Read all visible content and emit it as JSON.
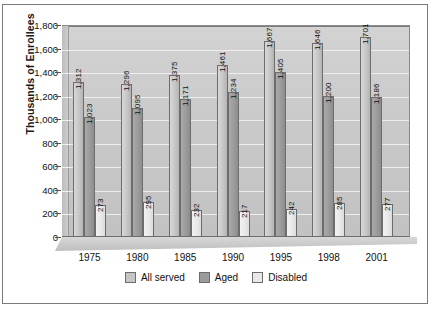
{
  "chart_data": {
    "type": "bar",
    "title": "",
    "subtitle": "",
    "xlabel": "",
    "ylabel": "Thousands of Enrollees",
    "categories": [
      "1975",
      "1980",
      "1985",
      "1990",
      "1995",
      "1998",
      "2001"
    ],
    "ylim": [
      0,
      1800
    ],
    "yticks": [
      "0",
      "200",
      "400",
      "600",
      "800",
      "1,000",
      "1,200",
      "1,400",
      "1,600",
      "1,800"
    ],
    "ytick_values": [
      0,
      200,
      400,
      600,
      800,
      1000,
      1200,
      1400,
      1600,
      1800
    ],
    "grid": true,
    "legend_position": "bottom",
    "series": [
      {
        "name": "All served",
        "color": "#c6c6c6",
        "values": [
          1312,
          1296,
          1375,
          1461,
          1667,
          1646,
          1701
        ],
        "labels": [
          "1,312",
          "1,296",
          "1,375",
          "1,461",
          "1,667",
          "1,646",
          "1,701"
        ]
      },
      {
        "name": "Aged",
        "color": "#9b9b9b",
        "values": [
          1023,
          1095,
          1171,
          1234,
          1405,
          1200,
          1186
        ],
        "labels": [
          "1,023",
          "1,095",
          "1,171",
          "1,234",
          "1,405",
          "1,200",
          "1,186"
        ]
      },
      {
        "name": "Disabled",
        "color": "#e8e8e8",
        "values": [
          273,
          295,
          232,
          217,
          242,
          285,
          277
        ],
        "labels": [
          "273",
          "295",
          "232",
          "217",
          "242",
          "285",
          "277"
        ]
      }
    ]
  }
}
